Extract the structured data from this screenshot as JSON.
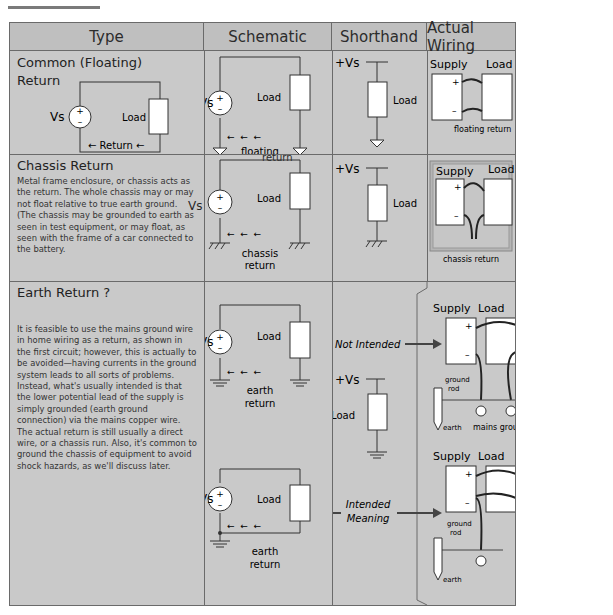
{
  "page": {
    "title_visible": ""
  },
  "headers": [
    "Type",
    "Schematic",
    "Shorthand",
    "Actual Wiring"
  ],
  "rows": [
    {
      "type_title_line1": "Common (Floating)",
      "type_title_line2": "Return",
      "type_diagram": {
        "source_label": "Vs",
        "load_label": "Load",
        "return_label": "← Return ←"
      },
      "schematic": {
        "source_label": "Vs",
        "load_label": "Load",
        "return_label_1": "floating",
        "return_label_2": "return"
      },
      "shorthand": {
        "supply_label": "+Vs",
        "load_label": "Load"
      },
      "wiring": {
        "supply_label": "Supply",
        "load_label": "Load",
        "plus": "+",
        "minus": "–",
        "return_label": "floating return"
      }
    },
    {
      "type_title": "Chassis Return",
      "description": "Metal frame enclosure, or chassis acts as the return. The whole chassis may or may not float relative to true earth ground. (The chassis may be grounded to earth as seen in test equipment, or may float, as seen with the frame of a car connected to the battery.",
      "schematic": {
        "source_label": "Vs",
        "load_label": "Load",
        "return_label_1": "chassis",
        "return_label_2": "return"
      },
      "shorthand": {
        "supply_label": "+Vs",
        "load_label": "Load"
      },
      "wiring": {
        "supply_label": "Supply",
        "load_label": "Load",
        "plus": "+",
        "minus": "–",
        "return_label": "chassis return"
      }
    },
    {
      "type_title": "Earth Return ?",
      "description": "It is feasible to use the mains ground wire in home wiring as a return, as shown in the first circuit; however, this is actually to be avoided—having currents in the ground system leads to all sorts of problems. Instead, what's usually intended is that the lower potential lead of the supply is simply grounded (earth ground connection) via the mains copper wire. The actual return is still usually a direct wire, or a chassis run. Also, it's common to ground the chassis of equipment to avoid shock hazards, as we'll discuss later.",
      "schematic_top": {
        "source_label": "Vs",
        "load_label": "Load",
        "return_label_1": "earth",
        "return_label_2": "return"
      },
      "schematic_bottom": {
        "source_label": "Vs",
        "load_label": "Load",
        "return_label_1": "earth",
        "return_label_2": "return"
      },
      "shorthand": {
        "not_intended": "Not Intended",
        "supply_label": "+Vs",
        "load_label": "Load",
        "intended_1": "Intended",
        "intended_2": "Meaning"
      },
      "wiring_top": {
        "supply_label": "Supply",
        "load_label": "Load",
        "plus": "+",
        "minus": "–",
        "rod_1": "ground",
        "rod_2": "rod",
        "earth": "earth",
        "mains": "mains ground"
      },
      "wiring_bottom": {
        "supply_label": "Supply",
        "load_label": "Load",
        "plus": "+",
        "minus": "–",
        "rod_1": "ground",
        "rod_2": "rod",
        "earth": "earth"
      }
    }
  ]
}
